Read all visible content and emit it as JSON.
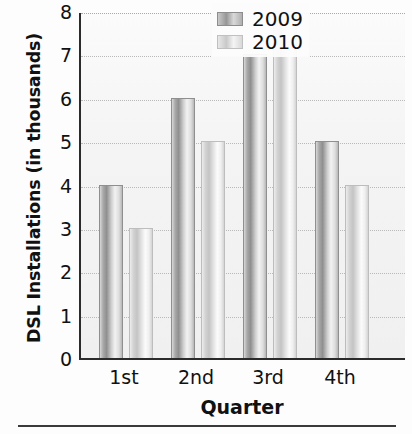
{
  "chart_data": {
    "type": "bar",
    "title": "",
    "xlabel": "Quarter",
    "ylabel": "DSL Installations (in thousands)",
    "categories": [
      "1st",
      "2nd",
      "3rd",
      "4th"
    ],
    "series": [
      {
        "name": "2009",
        "values": [
          4,
          6,
          7,
          5
        ],
        "color": "#9a9a9a"
      },
      {
        "name": "2010",
        "values": [
          3,
          5,
          8,
          4
        ],
        "color": "#d5d5d5"
      }
    ],
    "ylim": [
      0,
      8
    ],
    "ytick_labels": [
      "8",
      "7",
      "6",
      "5",
      "4",
      "3",
      "2",
      "1",
      "0"
    ],
    "ytick_values": [
      8,
      7,
      6,
      5,
      4,
      3,
      2,
      1,
      0
    ],
    "ytick_step": 1,
    "grid": "horizontal-dotted",
    "legend_position": "top-right-inside",
    "legend_entries": [
      "2009",
      "2010"
    ]
  },
  "axes": {
    "y_title": "DSL Installations (in thousands)",
    "x_title": "Quarter"
  },
  "legend": {
    "items": [
      {
        "label": "2009"
      },
      {
        "label": "2010"
      }
    ]
  },
  "ticks": {
    "y": [
      "8",
      "7",
      "6",
      "5",
      "4",
      "3",
      "2",
      "1",
      "0"
    ],
    "x": [
      "1st",
      "2nd",
      "3rd",
      "4th"
    ]
  }
}
